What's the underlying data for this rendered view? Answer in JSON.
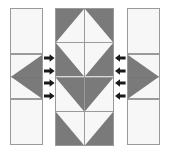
{
  "diagram": {
    "colors": {
      "fabric_dark": "#7a7a7a",
      "fabric_light": "#f7f7f7",
      "outline": "#9a9a9a",
      "arrow": "#1a1a1a",
      "background": "#ffffff"
    },
    "panels": [
      {
        "id": "left-strip",
        "name": "Left side strip",
        "columns": 1,
        "rows": 3,
        "cells": [
          {
            "row": 0,
            "col": 0,
            "pattern": "solid-light"
          },
          {
            "row": 1,
            "col": 0,
            "pattern": "triangle-point-left"
          },
          {
            "row": 2,
            "col": 0,
            "pattern": "solid-light"
          }
        ]
      },
      {
        "id": "center-block",
        "name": "Center block",
        "columns": 2,
        "rows": 4,
        "cells": [
          {
            "row": 0,
            "col": 0,
            "pattern": "hst-light-lower-left"
          },
          {
            "row": 0,
            "col": 1,
            "pattern": "hst-light-lower-right"
          },
          {
            "row": 1,
            "col": 0,
            "pattern": "hst-light-upper-right"
          },
          {
            "row": 1,
            "col": 1,
            "pattern": "hst-light-upper-left"
          },
          {
            "row": 2,
            "col": 0,
            "pattern": "hst-light-lower-right"
          },
          {
            "row": 2,
            "col": 1,
            "pattern": "hst-light-lower-left"
          },
          {
            "row": 3,
            "col": 0,
            "pattern": "hst-light-upper-right"
          },
          {
            "row": 3,
            "col": 1,
            "pattern": "hst-light-upper-left"
          }
        ]
      },
      {
        "id": "right-strip",
        "name": "Right side strip",
        "columns": 1,
        "rows": 3,
        "cells": [
          {
            "row": 0,
            "col": 0,
            "pattern": "solid-light"
          },
          {
            "row": 1,
            "col": 0,
            "pattern": "triangle-point-right"
          },
          {
            "row": 2,
            "col": 0,
            "pattern": "solid-light"
          }
        ]
      }
    ],
    "arrows": {
      "left_group": {
        "direction": "right",
        "count": 4,
        "meaning": "attach left strip to center block"
      },
      "right_group": {
        "direction": "left",
        "count": 4,
        "meaning": "attach right strip to center block"
      }
    }
  }
}
